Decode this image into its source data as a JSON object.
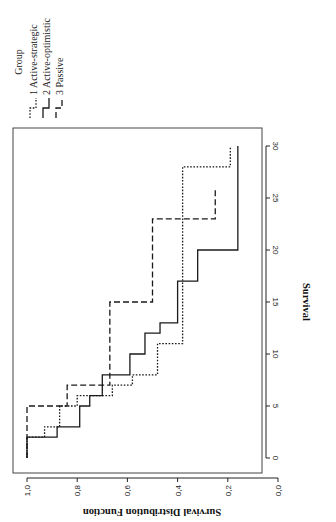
{
  "chart_data": {
    "type": "line",
    "subtype": "kaplan-meier step",
    "orientation": "rotated 90 degrees clockwise",
    "title": "",
    "xlabel": "Survival",
    "ylabel": "Survival Distribution Function",
    "xlim": [
      0,
      30
    ],
    "ylim": [
      0.0,
      1.0
    ],
    "x_ticks": [
      "0",
      "5",
      "10",
      "15",
      "20",
      "25",
      "30"
    ],
    "x_tick_values": [
      0,
      5,
      10,
      15,
      20,
      25,
      30
    ],
    "y_ticks": [
      "1,0",
      "0,8",
      "0,6",
      "0,4",
      "0,2",
      "0,0"
    ],
    "y_tick_values": [
      1.0,
      0.8,
      0.6,
      0.4,
      0.2,
      0.0
    ],
    "grid": false,
    "legend": {
      "title": "Group",
      "placement": "top",
      "entries": [
        {
          "label": "1 Active-strategic",
          "style": "dotted"
        },
        {
          "label": "2 Active-optimistic",
          "style": "solid"
        },
        {
          "label": "3 Passive",
          "style": "dashed"
        }
      ]
    },
    "series": [
      {
        "name": "1 Active-strategic",
        "style": "dotted",
        "steps": [
          {
            "t": 0,
            "s": 1.0
          },
          {
            "t": 2,
            "s": 0.93
          },
          {
            "t": 3,
            "s": 0.87
          },
          {
            "t": 5,
            "s": 0.8
          },
          {
            "t": 6,
            "s": 0.66
          },
          {
            "t": 7,
            "s": 0.58
          },
          {
            "t": 8,
            "s": 0.48
          },
          {
            "t": 11,
            "s": 0.38
          },
          {
            "t": 28,
            "s": 0.19
          }
        ],
        "end_t": 30
      },
      {
        "name": "2 Active-optimistic",
        "style": "solid",
        "steps": [
          {
            "t": 0,
            "s": 1.0
          },
          {
            "t": 2,
            "s": 0.88
          },
          {
            "t": 3,
            "s": 0.79
          },
          {
            "t": 5,
            "s": 0.75
          },
          {
            "t": 6,
            "s": 0.7
          },
          {
            "t": 8,
            "s": 0.59
          },
          {
            "t": 10,
            "s": 0.53
          },
          {
            "t": 12,
            "s": 0.47
          },
          {
            "t": 13,
            "s": 0.4
          },
          {
            "t": 17,
            "s": 0.32
          },
          {
            "t": 20,
            "s": 0.16
          }
        ],
        "end_t": 30
      },
      {
        "name": "3 Passive",
        "style": "dashed",
        "steps": [
          {
            "t": 0,
            "s": 1.0
          },
          {
            "t": 5,
            "s": 0.84
          },
          {
            "t": 7,
            "s": 0.67
          },
          {
            "t": 15,
            "s": 0.5
          },
          {
            "t": 23,
            "s": 0.25
          }
        ],
        "end_t": 26
      }
    ]
  }
}
